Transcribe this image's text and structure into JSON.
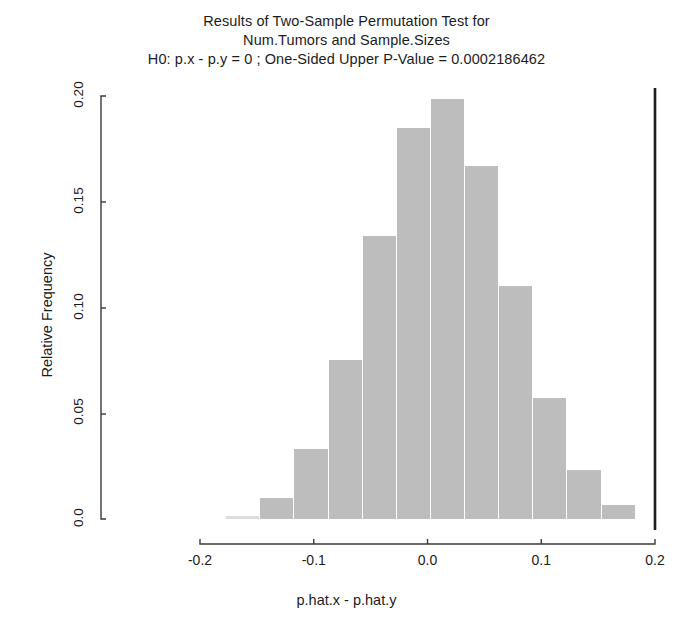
{
  "chart_data": {
    "type": "bar",
    "title": "Results of Two-Sample Permutation Test for",
    "title_line2": "Num.Tumors and Sample.Sizes",
    "title_line3": "H0: p.x - p.y = 0 ;  One-Sided Upper P-Value = 0.0002186462",
    "xlabel": "p.hat.x - p.hat.y",
    "ylabel": "Relative Frequency",
    "xlim": [
      -0.2,
      0.2
    ],
    "ylim": [
      0.0,
      0.2
    ],
    "grid": false,
    "legend": false,
    "bar_color": "#bdbdbd",
    "bin_width": 0.03,
    "xticks": [
      "-0.2",
      "-0.1",
      "0.0",
      "0.1",
      "0.2"
    ],
    "xtick_values": [
      -0.2,
      -0.1,
      0.0,
      0.1,
      0.2
    ],
    "yticks": [
      "0.0",
      "0.05",
      "0.10",
      "0.15",
      "0.20"
    ],
    "ytick_values": [
      0.0,
      0.05,
      0.1,
      0.15,
      0.2
    ],
    "bins": [
      {
        "left": -0.177,
        "right": -0.147,
        "value": 0.0012
      },
      {
        "left": -0.147,
        "right": -0.117,
        "value": 0.01
      },
      {
        "left": -0.117,
        "right": -0.087,
        "value": 0.033
      },
      {
        "left": -0.087,
        "right": -0.057,
        "value": 0.0752
      },
      {
        "left": -0.057,
        "right": -0.027,
        "value": 0.1338
      },
      {
        "left": -0.027,
        "right": 0.003,
        "value": 0.1847
      },
      {
        "left": 0.003,
        "right": 0.033,
        "value": 0.1985
      },
      {
        "left": 0.033,
        "right": 0.063,
        "value": 0.1667
      },
      {
        "left": 0.063,
        "right": 0.093,
        "value": 0.11
      },
      {
        "left": 0.093,
        "right": 0.123,
        "value": 0.0573
      },
      {
        "left": 0.123,
        "right": 0.153,
        "value": 0.0232
      },
      {
        "left": 0.153,
        "right": 0.183,
        "value": 0.0066
      }
    ],
    "observed_statistic_line": 0.2,
    "p_value": "0.0002186462"
  }
}
